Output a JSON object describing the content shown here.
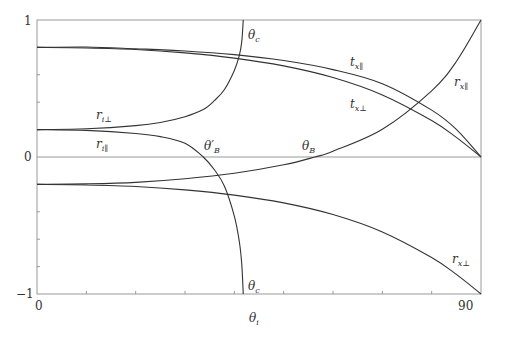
{
  "chart_data": {
    "type": "line",
    "title": "",
    "xlabel": "θi",
    "ylabel": "",
    "xlim": [
      0,
      90
    ],
    "ylim": [
      -1,
      1
    ],
    "grid": false,
    "x_tick_labels": [
      "0",
      "90"
    ],
    "y_tick_labels": [
      "1",
      "0",
      "−1"
    ],
    "minor_x_ticks": [
      10,
      20,
      30,
      40,
      50,
      60,
      70,
      80
    ],
    "minor_y_ticks": [
      -0.8,
      -0.6,
      -0.4,
      -0.2,
      0.2,
      0.4,
      0.6,
      0.8
    ],
    "series": [
      {
        "name": "t_x∥",
        "points": [
          [
            0,
            0.8
          ],
          [
            10,
            0.803
          ],
          [
            20,
            0.79
          ],
          [
            30,
            0.774
          ],
          [
            40,
            0.747
          ],
          [
            50,
            0.704
          ],
          [
            60,
            0.638
          ],
          [
            70,
            0.535
          ],
          [
            80,
            0.342
          ],
          [
            85,
            0.202
          ],
          [
            90,
            0
          ]
        ]
      },
      {
        "name": "t_x⊥",
        "points": [
          [
            0,
            0.8
          ],
          [
            10,
            0.796
          ],
          [
            20,
            0.785
          ],
          [
            30,
            0.76
          ],
          [
            40,
            0.722
          ],
          [
            50,
            0.665
          ],
          [
            60,
            0.58
          ],
          [
            70,
            0.453
          ],
          [
            80,
            0.266
          ],
          [
            85,
            0.143
          ],
          [
            90,
            0
          ]
        ]
      },
      {
        "name": "r_x∥",
        "points": [
          [
            0,
            -0.2
          ],
          [
            10,
            -0.196
          ],
          [
            20,
            -0.185
          ],
          [
            30,
            -0.159
          ],
          [
            40,
            -0.119
          ],
          [
            50,
            -0.057
          ],
          [
            56.3,
            0
          ],
          [
            60,
            0.042
          ],
          [
            70,
            0.202
          ],
          [
            80,
            0.483
          ],
          [
            85,
            0.697
          ],
          [
            90,
            1
          ]
        ]
      },
      {
        "name": "r_x⊥",
        "points": [
          [
            0,
            -0.2
          ],
          [
            10,
            -0.204
          ],
          [
            20,
            -0.215
          ],
          [
            30,
            -0.24
          ],
          [
            40,
            -0.278
          ],
          [
            50,
            -0.335
          ],
          [
            60,
            -0.42
          ],
          [
            70,
            -0.547
          ],
          [
            80,
            -0.734
          ],
          [
            85,
            -0.857
          ],
          [
            90,
            -1
          ]
        ]
      },
      {
        "name": "r_i⊥",
        "points": [
          [
            0,
            0.2
          ],
          [
            10,
            0.206
          ],
          [
            20,
            0.229
          ],
          [
            25,
            0.252
          ],
          [
            30,
            0.294
          ],
          [
            33.7,
            0.346
          ],
          [
            36,
            0.413
          ],
          [
            38,
            0.493
          ],
          [
            40,
            0.632
          ],
          [
            41,
            0.74
          ],
          [
            41.5,
            0.84
          ],
          [
            41.81,
            1
          ]
        ]
      },
      {
        "name": "r_i∥",
        "points": [
          [
            0,
            0.2
          ],
          [
            10,
            0.194
          ],
          [
            20,
            0.172
          ],
          [
            25,
            0.149
          ],
          [
            30,
            0.1
          ],
          [
            33.7,
            0
          ],
          [
            36,
            -0.095
          ],
          [
            38,
            -0.214
          ],
          [
            40,
            -0.432
          ],
          [
            41,
            -0.615
          ],
          [
            41.5,
            -0.78
          ],
          [
            41.81,
            -1
          ]
        ]
      }
    ],
    "annotations": [
      {
        "text": "θc",
        "x": 41.8,
        "position": "top"
      },
      {
        "text": "θc",
        "x": 41.8,
        "position": "bottom"
      },
      {
        "text": "θ'B",
        "x": 33.7
      },
      {
        "text": "θB",
        "x": 56.3
      }
    ],
    "line_color": "#333333",
    "axis_color": "#999999"
  },
  "labels": {
    "t_x_par": {
      "base": "t",
      "sub": "x∥"
    },
    "t_x_perp": {
      "base": "t",
      "sub": "x⊥"
    },
    "r_x_par": {
      "base": "r",
      "sub": "x∥"
    },
    "r_x_perp": {
      "base": "r",
      "sub": "x⊥"
    },
    "r_i_perp": {
      "base": "r",
      "sub": "i⊥"
    },
    "r_i_par": {
      "base": "r",
      "sub": "i∥"
    },
    "theta_c_top": {
      "base": "θ",
      "sub": "c"
    },
    "theta_c_bottom": {
      "base": "θ",
      "sub": "c"
    },
    "theta_b_prime": {
      "base": "θ′",
      "sub": "B"
    },
    "theta_b": {
      "base": "θ",
      "sub": "B"
    },
    "x_axis": {
      "base": "θ",
      "sub": "i"
    }
  }
}
